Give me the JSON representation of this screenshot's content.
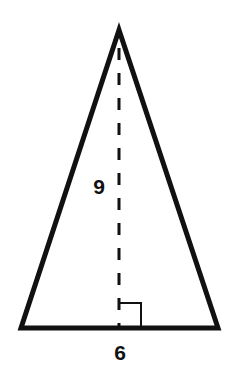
{
  "figure": {
    "type": "isosceles-triangle",
    "colors": {
      "stroke": "#111111",
      "background": "#ffffff"
    },
    "vertices": {
      "apex": [
        119,
        30
      ],
      "base_left": [
        21,
        328
      ],
      "base_right": [
        218,
        328
      ]
    },
    "height_line": {
      "style": "dashed",
      "x": 119,
      "y_start": 30,
      "y_end": 328
    },
    "right_angle_marker": {
      "x": 119,
      "y": 303,
      "size": 22
    },
    "labels": {
      "height": "9",
      "base": "6"
    }
  }
}
